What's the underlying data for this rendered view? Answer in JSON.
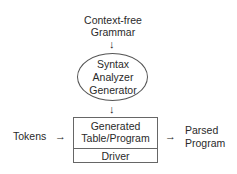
{
  "diagram": {
    "input": {
      "line1": "Context-free",
      "line2": "Grammar"
    },
    "generator": {
      "line1": "Syntax",
      "line2": "Analyzer",
      "line3": "Generator"
    },
    "parser_box": {
      "top_line1": "Generated",
      "top_line2": "Table/Program",
      "bottom": "Driver"
    },
    "left_input": "Tokens",
    "output": {
      "line1": "Parsed",
      "line2": "Program"
    },
    "arrows": {
      "down": "↓",
      "right": "→"
    }
  }
}
